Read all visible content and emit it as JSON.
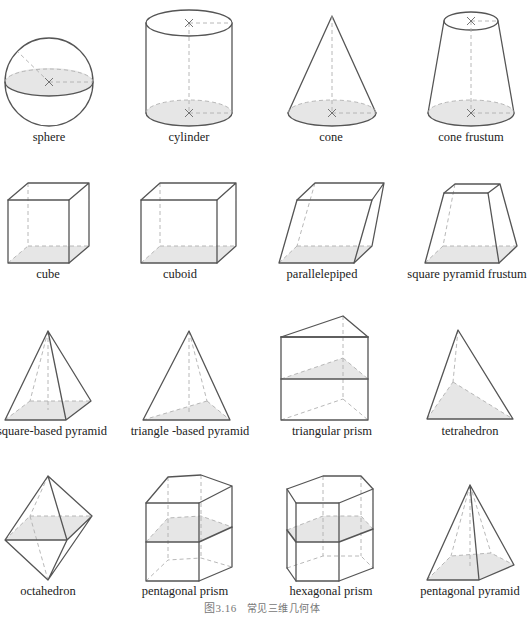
{
  "figure": {
    "caption_number": "图3.16",
    "caption_text": "常见三维几何体",
    "rows": [
      {
        "shapes": [
          {
            "id": "sphere",
            "label": "sphere"
          },
          {
            "id": "cylinder",
            "label": "cylinder"
          },
          {
            "id": "cone",
            "label": "cone"
          },
          {
            "id": "cone-frustum",
            "label": "cone frustum"
          }
        ]
      },
      {
        "shapes": [
          {
            "id": "cube",
            "label": "cube"
          },
          {
            "id": "cuboid",
            "label": "cuboid"
          },
          {
            "id": "parallelepiped",
            "label": "parallelepiped"
          },
          {
            "id": "square-pyramid-frustum",
            "label": "square pyramid frustum"
          }
        ]
      },
      {
        "shapes": [
          {
            "id": "square-based-pyramid",
            "label": "square-based pyramid"
          },
          {
            "id": "triangle-based-pyramid",
            "label": "triangle -based pyramid"
          },
          {
            "id": "triangular-prism",
            "label": "triangular prism"
          },
          {
            "id": "tetrahedron",
            "label": "tetrahedron"
          }
        ]
      },
      {
        "shapes": [
          {
            "id": "octahedron",
            "label": "octahedron"
          },
          {
            "id": "pentagonal-prism",
            "label": "pentagonal prism"
          },
          {
            "id": "hexagonal-prism",
            "label": "hexagonal prism"
          },
          {
            "id": "pentagonal-pyramid",
            "label": "pentagonal pyramid"
          }
        ]
      }
    ]
  },
  "colors": {
    "edge": "#555555",
    "hidden_edge": "#b0b0b0",
    "shaded_face": "#e6e6e6",
    "background": "#ffffff"
  }
}
